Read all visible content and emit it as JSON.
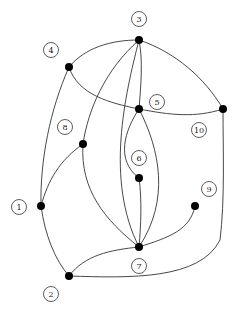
{
  "diagram": {
    "type": "graph",
    "nodes": [
      {
        "id": "1",
        "label": "1"
      },
      {
        "id": "2",
        "label": "2"
      },
      {
        "id": "3",
        "label": "3"
      },
      {
        "id": "4",
        "label": "4"
      },
      {
        "id": "5",
        "label": "5"
      },
      {
        "id": "6",
        "label": "6"
      },
      {
        "id": "7",
        "label": "7"
      },
      {
        "id": "8",
        "label": "8"
      },
      {
        "id": "9",
        "label": "9"
      },
      {
        "id": "10",
        "label": "10"
      }
    ],
    "edges": [
      {
        "from": "3",
        "to": "4"
      },
      {
        "from": "3",
        "to": "10"
      },
      {
        "from": "3",
        "to": "5"
      },
      {
        "from": "3",
        "to": "8"
      },
      {
        "from": "3",
        "to": "7"
      },
      {
        "from": "4",
        "to": "5"
      },
      {
        "from": "5",
        "to": "10"
      },
      {
        "from": "4",
        "to": "1"
      },
      {
        "from": "8",
        "to": "1"
      },
      {
        "from": "8",
        "to": "7"
      },
      {
        "from": "5",
        "to": "6"
      },
      {
        "from": "5",
        "to": "7"
      },
      {
        "from": "6",
        "to": "7"
      },
      {
        "from": "1",
        "to": "2"
      },
      {
        "from": "2",
        "to": "7"
      },
      {
        "from": "2",
        "to": "10"
      },
      {
        "from": "7",
        "to": "9"
      }
    ]
  }
}
